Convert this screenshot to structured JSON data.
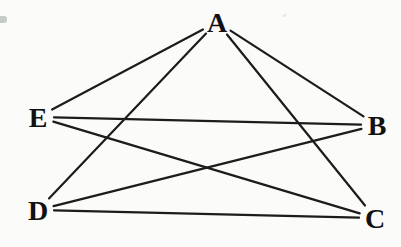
{
  "figure": {
    "type": "graph-diagram",
    "background_color": "#fbfbf9",
    "edge_color": "#1c1c1c",
    "label_color": "#111111",
    "chart_data": {
      "type": "node-link-graph",
      "nodes": [
        {
          "id": "A",
          "x": 217,
          "y": 22
        },
        {
          "id": "E",
          "x": 38,
          "y": 117
        },
        {
          "id": "B",
          "x": 377,
          "y": 125
        },
        {
          "id": "D",
          "x": 38,
          "y": 210
        },
        {
          "id": "C",
          "x": 375,
          "y": 218
        }
      ],
      "edges": [
        {
          "from": "A",
          "to": "E"
        },
        {
          "from": "A",
          "to": "B"
        },
        {
          "from": "A",
          "to": "D"
        },
        {
          "from": "A",
          "to": "C"
        },
        {
          "from": "E",
          "to": "B"
        },
        {
          "from": "E",
          "to": "C"
        },
        {
          "from": "D",
          "to": "B"
        },
        {
          "from": "D",
          "to": "C"
        }
      ],
      "label_trim_radius": 16,
      "edge_stroke_width": 2.2
    }
  }
}
